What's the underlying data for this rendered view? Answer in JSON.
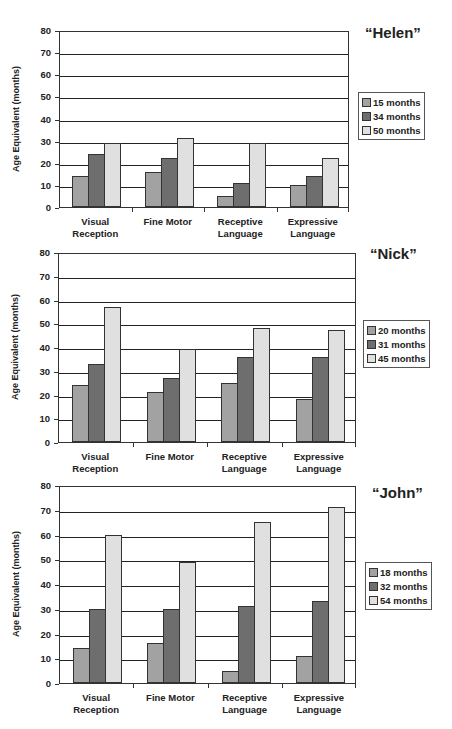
{
  "chart_data": [
    {
      "type": "bar",
      "title": "“Helen”",
      "xlabel": "",
      "ylabel": "Age Equivalent (months)",
      "ylim": [
        0,
        80
      ],
      "yticks": [
        "0",
        "10",
        "20",
        "30",
        "40",
        "50",
        "60",
        "70",
        "80"
      ],
      "grid": true,
      "legend_position": "right",
      "categories": [
        "Visual Reception",
        "Fine Motor",
        "Receptive Language",
        "Expressive Language"
      ],
      "category_lines": [
        [
          "Visual",
          "Reception"
        ],
        [
          "Fine Motor",
          ""
        ],
        [
          "Receptive",
          "Language"
        ],
        [
          "Expressive",
          "Language"
        ]
      ],
      "series": [
        {
          "name": "15 months",
          "values": [
            14,
            16,
            5,
            10
          ]
        },
        {
          "name": "34 months",
          "values": [
            24,
            22,
            11,
            14
          ]
        },
        {
          "name": "50 months",
          "values": [
            29,
            31,
            29,
            22
          ]
        }
      ]
    },
    {
      "type": "bar",
      "title": "“Nick”",
      "xlabel": "",
      "ylabel": "Age Equivalent (months)",
      "ylim": [
        0,
        80
      ],
      "yticks": [
        "0",
        "10",
        "20",
        "30",
        "40",
        "50",
        "60",
        "70",
        "80"
      ],
      "grid": true,
      "legend_position": "right",
      "categories": [
        "Visual Reception",
        "Fine Motor",
        "Receptive Language",
        "Expressive Language"
      ],
      "category_lines": [
        [
          "Visual",
          "Reception"
        ],
        [
          "Fine Motor",
          ""
        ],
        [
          "Receptive",
          "Language"
        ],
        [
          "Expressive",
          "Language"
        ]
      ],
      "series": [
        {
          "name": "20 months",
          "values": [
            24,
            21,
            25,
            18
          ]
        },
        {
          "name": "31 months",
          "values": [
            33,
            27,
            36,
            36
          ]
        },
        {
          "name": "45 months",
          "values": [
            57,
            39,
            48,
            47
          ]
        }
      ]
    },
    {
      "type": "bar",
      "title": "“John”",
      "xlabel": "",
      "ylabel": "Age Equivalent (months)",
      "ylim": [
        0,
        80
      ],
      "yticks": [
        "0",
        "10",
        "20",
        "30",
        "40",
        "50",
        "60",
        "70",
        "80"
      ],
      "grid": true,
      "legend_position": "right",
      "categories": [
        "Visual Reception",
        "Fine Motor",
        "Receptive Language",
        "Expressive Language"
      ],
      "category_lines": [
        [
          "Visual",
          "Reception"
        ],
        [
          "Fine Motor",
          ""
        ],
        [
          "Receptive",
          "Language"
        ],
        [
          "Expressive",
          "Language"
        ]
      ],
      "series": [
        {
          "name": "18 months",
          "values": [
            14,
            16,
            5,
            11
          ]
        },
        {
          "name": "32 months",
          "values": [
            30,
            30,
            31,
            33
          ]
        },
        {
          "name": "54 months",
          "values": [
            60,
            49,
            65,
            71
          ]
        }
      ]
    }
  ],
  "colors": {
    "series_0": "#a2a2a2",
    "series_1": "#6e6e6e",
    "series_2": "#e0e0e0",
    "axis": "#333333"
  }
}
